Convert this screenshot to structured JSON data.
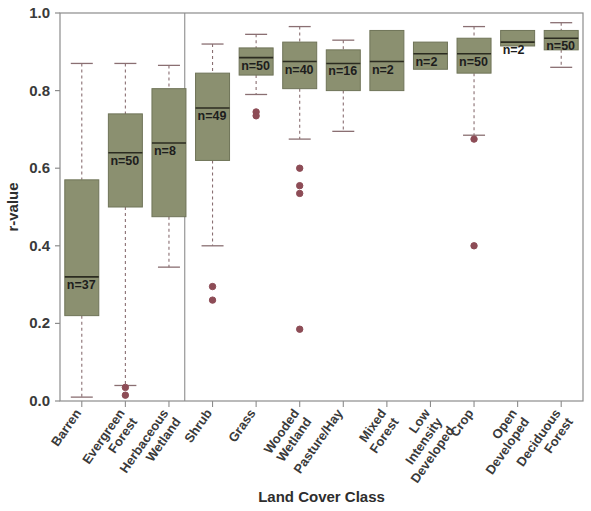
{
  "chart_data": {
    "type": "box",
    "title": "",
    "xlabel": "Land Cover Class",
    "ylabel": "r-value",
    "ylim": [
      0.0,
      1.0
    ],
    "yticks": [
      0.0,
      0.2,
      0.4,
      0.6,
      0.8,
      1.0
    ],
    "ytick_labels": [
      "0.0",
      "0.2",
      "0.4",
      "0.6",
      "0.8",
      "1.0"
    ],
    "grid": false,
    "legend": "none",
    "box_fill_color": "#8b9070",
    "box_edge_color": "#6f7458",
    "whisker_color": "#8a6f72",
    "outlier_color": "#8d4c56",
    "frame_color": "#8c8c8c",
    "group_separator_x_class_index": 3,
    "categories": [
      "Barren",
      "Evergreen Forest",
      "Herbaceous Wetland",
      "Shrub",
      "Grass",
      "Wooded Wetland",
      "Pasture/Hay",
      "Mixed Forest",
      "Low Intensity Developed",
      "Crop",
      "Open Developed",
      "Deciduous Forest"
    ],
    "boxes": [
      {
        "category": "Barren",
        "n_label": "n=37",
        "n": 37,
        "whisker_low": 0.01,
        "q1": 0.22,
        "median": 0.32,
        "q3": 0.57,
        "whisker_high": 0.87,
        "outliers": []
      },
      {
        "category": "Evergreen Forest",
        "n_label": "n=50",
        "n": 50,
        "whisker_low": 0.04,
        "q1": 0.5,
        "median": 0.64,
        "q3": 0.74,
        "whisker_high": 0.87,
        "outliers": [
          0.035,
          0.015
        ]
      },
      {
        "category": "Herbaceous Wetland",
        "n_label": "n=8",
        "n": 8,
        "whisker_low": 0.345,
        "q1": 0.475,
        "median": 0.665,
        "q3": 0.805,
        "whisker_high": 0.865,
        "outliers": []
      },
      {
        "category": "Shrub",
        "n_label": "n=49",
        "n": 49,
        "whisker_low": 0.4,
        "q1": 0.62,
        "median": 0.755,
        "q3": 0.845,
        "whisker_high": 0.92,
        "outliers": [
          0.295,
          0.26
        ]
      },
      {
        "category": "Grass",
        "n_label": "n=50",
        "n": 50,
        "whisker_low": 0.79,
        "q1": 0.84,
        "median": 0.885,
        "q3": 0.91,
        "whisker_high": 0.945,
        "outliers": [
          0.745,
          0.735
        ]
      },
      {
        "category": "Wooded Wetland",
        "n_label": "n=40",
        "n": 40,
        "whisker_low": 0.675,
        "q1": 0.805,
        "median": 0.875,
        "q3": 0.925,
        "whisker_high": 0.965,
        "outliers": [
          0.6,
          0.555,
          0.535,
          0.185
        ]
      },
      {
        "category": "Pasture/Hay",
        "n_label": "n=16",
        "n": 16,
        "whisker_low": 0.695,
        "q1": 0.8,
        "median": 0.87,
        "q3": 0.905,
        "whisker_high": 0.93,
        "outliers": []
      },
      {
        "category": "Mixed Forest",
        "n_label": "n=2",
        "n": 2,
        "whisker_low": 0.8,
        "q1": 0.8,
        "median": 0.875,
        "q3": 0.955,
        "whisker_high": 0.955,
        "outliers": []
      },
      {
        "category": "Low Intensity Developed",
        "n_label": "n=2",
        "n": 2,
        "whisker_low": 0.855,
        "q1": 0.855,
        "median": 0.895,
        "q3": 0.925,
        "whisker_high": 0.925,
        "outliers": []
      },
      {
        "category": "Crop",
        "n_label": "n=50",
        "n": 50,
        "whisker_low": 0.685,
        "q1": 0.845,
        "median": 0.895,
        "q3": 0.935,
        "whisker_high": 0.965,
        "outliers": [
          0.675,
          0.4
        ]
      },
      {
        "category": "Open Developed",
        "n_label": "n=2",
        "n": 2,
        "whisker_low": 0.915,
        "q1": 0.915,
        "median": 0.925,
        "q3": 0.955,
        "whisker_high": 0.955,
        "outliers": []
      },
      {
        "category": "Deciduous Forest",
        "n_label": "n=50",
        "n": 50,
        "whisker_low": 0.86,
        "q1": 0.905,
        "median": 0.935,
        "q3": 0.955,
        "whisker_high": 0.975,
        "outliers": []
      }
    ]
  }
}
